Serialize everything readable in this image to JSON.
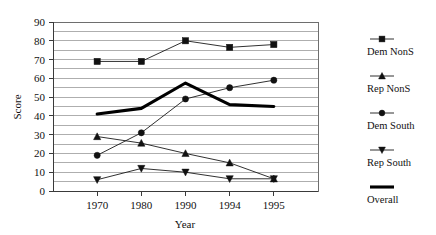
{
  "chart_data": {
    "type": "line",
    "title": "",
    "xlabel": "Year",
    "ylabel": "Score",
    "categories": [
      "1970",
      "1980",
      "1990",
      "1994",
      "1995"
    ],
    "ylim": [
      0,
      90
    ],
    "ytick_step": 10,
    "gridline_step": 5,
    "grid": true,
    "legend_position": "right",
    "yticks": [
      "0",
      "10",
      "20",
      "30",
      "40",
      "50",
      "60",
      "70",
      "80",
      "90"
    ],
    "series": [
      {
        "name": "Dem NonS",
        "marker": "square",
        "values": [
          69,
          69,
          80,
          76.5,
          78
        ]
      },
      {
        "name": "Rep NonS",
        "marker": "triangle-up",
        "values": [
          29,
          25.5,
          20,
          15,
          6.5
        ]
      },
      {
        "name": "Dem South",
        "marker": "circle",
        "values": [
          19,
          31,
          49,
          55,
          59
        ]
      },
      {
        "name": "Rep South",
        "marker": "triangle-down",
        "values": [
          6,
          12,
          10,
          6.5,
          6.5
        ]
      },
      {
        "name": "Overall",
        "marker": "none",
        "values": [
          41,
          44,
          57.5,
          46,
          45
        ]
      }
    ]
  },
  "axes": {
    "y_title": "Score",
    "x_title": "Year"
  },
  "legend": {
    "items": [
      {
        "label": "Dem NonS",
        "marker": "square"
      },
      {
        "label": "Rep NonS",
        "marker": "triangle-up"
      },
      {
        "label": "Dem South",
        "marker": "circle"
      },
      {
        "label": "Rep South",
        "marker": "triangle-down"
      },
      {
        "label": "Overall",
        "marker": "thick-line"
      }
    ]
  },
  "colors": {
    "series": "#111111",
    "grid": "#9a9a9a",
    "frame": "#6e6e6e",
    "background": "#ffffff"
  }
}
